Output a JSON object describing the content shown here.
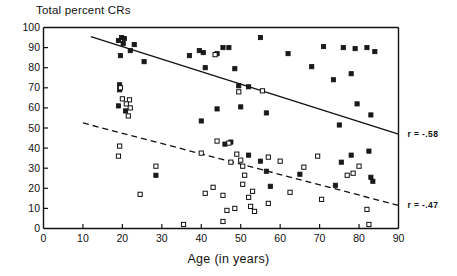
{
  "chart_data": {
    "type": "scatter",
    "title": "Total percent CRs",
    "xlabel": "Age (in years)",
    "ylabel": "",
    "xlim": [
      0,
      90
    ],
    "ylim": [
      0,
      100
    ],
    "xticks": [
      0,
      10,
      20,
      30,
      40,
      50,
      60,
      70,
      80,
      90
    ],
    "yticks": [
      0,
      10,
      20,
      30,
      40,
      50,
      60,
      70,
      80,
      90,
      100
    ],
    "grid": false,
    "legend": "none",
    "series": [
      {
        "name": "filled-squares",
        "marker": "filled square",
        "points": [
          [
            19.0,
            93.5
          ],
          [
            19.8,
            95.0
          ],
          [
            20.5,
            94.5
          ],
          [
            20.2,
            92.0
          ],
          [
            23.0,
            91.5
          ],
          [
            22.0,
            88.5
          ],
          [
            19.5,
            86.0
          ],
          [
            25.5,
            83.0
          ],
          [
            19.3,
            71.5
          ],
          [
            19.3,
            69.0
          ],
          [
            19.0,
            61.0
          ],
          [
            20.8,
            58.5
          ],
          [
            37.0,
            86.0
          ],
          [
            39.5,
            88.5
          ],
          [
            40.5,
            87.5
          ],
          [
            44.0,
            87.0
          ],
          [
            45.5,
            90.0
          ],
          [
            47.0,
            90.0
          ],
          [
            41.0,
            80.0
          ],
          [
            48.5,
            79.5
          ],
          [
            55.0,
            95.0
          ],
          [
            49.5,
            71.0
          ],
          [
            52.0,
            70.5
          ],
          [
            50.0,
            60.5
          ],
          [
            44.0,
            59.5
          ],
          [
            40.0,
            53.5
          ],
          [
            56.5,
            57.5
          ],
          [
            62.0,
            87.0
          ],
          [
            68.0,
            80.5
          ],
          [
            71.0,
            90.5
          ],
          [
            73.5,
            74.0
          ],
          [
            76.0,
            90.0
          ],
          [
            79.0,
            89.5
          ],
          [
            82.0,
            90.0
          ],
          [
            84.0,
            88.0
          ],
          [
            78.0,
            77.0
          ],
          [
            79.5,
            62.0
          ],
          [
            83.0,
            56.5
          ],
          [
            75.0,
            51.5
          ],
          [
            46.0,
            42.0
          ],
          [
            47.5,
            43.0
          ],
          [
            52.0,
            36.5
          ],
          [
            55.0,
            33.5
          ],
          [
            56.5,
            28.5
          ],
          [
            28.5,
            26.5
          ],
          [
            57.5,
            21.0
          ],
          [
            65.0,
            27.0
          ],
          [
            74.0,
            21.5
          ],
          [
            75.5,
            33.0
          ],
          [
            78.0,
            36.5
          ],
          [
            83.0,
            25.5
          ],
          [
            83.5,
            23.5
          ],
          [
            82.5,
            38.5
          ]
        ]
      },
      {
        "name": "open-squares",
        "marker": "open square",
        "points": [
          [
            19.5,
            70.0
          ],
          [
            20.0,
            64.5
          ],
          [
            21.8,
            64.0
          ],
          [
            21.0,
            62.0
          ],
          [
            22.0,
            60.0
          ],
          [
            21.5,
            56.0
          ],
          [
            19.3,
            41.0
          ],
          [
            19.0,
            36.0
          ],
          [
            24.5,
            17.0
          ],
          [
            28.5,
            31.0
          ],
          [
            35.5,
            2.0
          ],
          [
            40.0,
            37.5
          ],
          [
            43.5,
            86.5
          ],
          [
            44.0,
            43.5
          ],
          [
            41.0,
            17.5
          ],
          [
            43.0,
            20.5
          ],
          [
            45.5,
            16.5
          ],
          [
            45.5,
            3.5
          ],
          [
            46.5,
            9.0
          ],
          [
            47.5,
            33.0
          ],
          [
            47.0,
            42.5
          ],
          [
            49.0,
            37.0
          ],
          [
            50.0,
            34.0
          ],
          [
            50.5,
            31.0
          ],
          [
            50.5,
            22.0
          ],
          [
            51.0,
            26.5
          ],
          [
            52.0,
            15.5
          ],
          [
            52.5,
            11.0
          ],
          [
            53.5,
            8.5
          ],
          [
            48.5,
            10.0
          ],
          [
            49.5,
            68.0
          ],
          [
            55.5,
            68.5
          ],
          [
            57.0,
            35.5
          ],
          [
            53.0,
            18.5
          ],
          [
            57.0,
            12.5
          ],
          [
            60.0,
            33.5
          ],
          [
            62.5,
            18.0
          ],
          [
            66.0,
            30.5
          ],
          [
            69.5,
            36.0
          ],
          [
            70.5,
            14.5
          ],
          [
            77.0,
            26.5
          ],
          [
            78.5,
            27.5
          ],
          [
            80.0,
            31.0
          ],
          [
            82.5,
            2.0
          ],
          [
            82.0,
            9.5
          ]
        ]
      }
    ],
    "trendlines": [
      {
        "name": "solid-regression",
        "style": "solid",
        "x0": 12,
        "y0": 95.5,
        "x1": 90,
        "y1": 47.0,
        "label": "r = -.58",
        "label_x": 91,
        "label_y": 47.0
      },
      {
        "name": "dashed-regression",
        "style": "dashed",
        "x0": 10,
        "y0": 52.5,
        "x1": 90,
        "y1": 11.5,
        "label": "r = -.47",
        "label_x": 91,
        "label_y": 11.5
      }
    ],
    "annotations": [
      {
        "text": "r = -.58",
        "for": "solid-regression"
      },
      {
        "text": "r = -.47",
        "for": "dashed-regression"
      }
    ]
  },
  "axis": {
    "x_tick_labels": [
      "0",
      "10",
      "20",
      "30",
      "40",
      "50",
      "60",
      "70",
      "80",
      "90"
    ],
    "y_tick_labels": [
      "0",
      "10",
      "20",
      "30",
      "40",
      "50",
      "60",
      "70",
      "80",
      "90",
      "100"
    ]
  },
  "colors": {
    "ink": "#111111",
    "background": "#ffffff",
    "marker_fill": "#1a1a1a",
    "marker_open": "#ffffff"
  }
}
